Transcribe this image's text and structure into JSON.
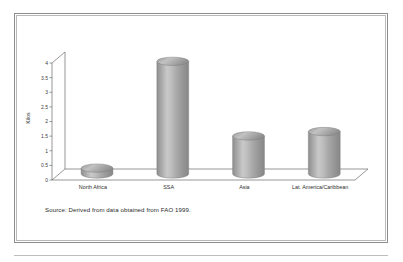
{
  "chart_data": {
    "type": "bar",
    "title": "",
    "subtitle": "",
    "xlabel": "",
    "ylabel": "Kilos",
    "categories": [
      "North Africa",
      "SSA",
      "Asia",
      "Lat. America/Caribbean"
    ],
    "values": [
      0.2,
      3.85,
      1.3,
      1.45
    ],
    "series": [
      {
        "name": "Kilos",
        "values": [
          0.2,
          3.85,
          1.3,
          1.45
        ]
      }
    ],
    "ylim": [
      0,
      4
    ],
    "ytick_labels": [
      "0",
      "0.5",
      "1",
      "1.5",
      "2",
      "2.5",
      "3",
      "3.5",
      "4"
    ],
    "ytick_values": [
      0,
      0.5,
      1,
      1.5,
      2,
      2.5,
      3,
      3.5,
      4
    ],
    "grid": false,
    "legend": false,
    "legend_position": "none",
    "style": "3d-cylinder",
    "annotation": "Source: Derived from data obtained from FAO 1999."
  },
  "figure": {
    "source_note": "Source: Derived from data obtained from FAO 1999."
  },
  "colors": {
    "bar_dark": "#8a8a8a",
    "bar_light": "#c9c9c9",
    "bar_mid": "#a6a6a6",
    "bar_top": "#b4b4b4",
    "axis": "#6b6b6b",
    "frame_outer": "#8d8d8d",
    "frame_inner": "#b9b9b9",
    "text": "#2e2e2e",
    "background": "#ffffff"
  }
}
